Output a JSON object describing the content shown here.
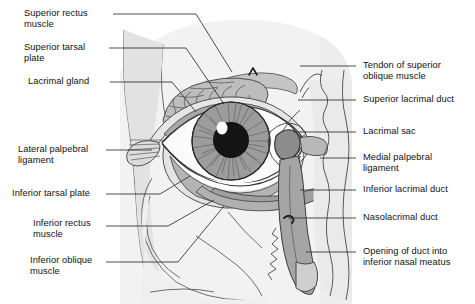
{
  "figure": {
    "background_color": "#ffffff",
    "tissue_color": "#f0f0f0",
    "shade_color": "#c9c9c9",
    "dark_shade_color": "#9a9a9a",
    "line_color": "#3a3a3a",
    "text_color": "#111111"
  },
  "labels_left": [
    {
      "text": "Superior rectus\nmuscle",
      "x": 24,
      "y": 8
    },
    {
      "text": "Superior tarsal\nplate",
      "x": 24,
      "y": 42
    },
    {
      "text": "Lacrimal gland",
      "x": 28,
      "y": 76
    },
    {
      "text": "Lateral palpebral\nligament",
      "x": 18,
      "y": 144
    },
    {
      "text": "Inferior tarsal plate",
      "x": 12,
      "y": 190
    },
    {
      "text": "Inferior rectus\nmuscle",
      "x": 33,
      "y": 218
    },
    {
      "text": "Inferior oblique\nmuscle",
      "x": 30,
      "y": 255
    }
  ],
  "labels_right": [
    {
      "text": "Tendon of superior\noblique muscle",
      "x": 363,
      "y": 60
    },
    {
      "text": "Superior lacrimal duct",
      "x": 363,
      "y": 96
    },
    {
      "text": "Lacrimal sac",
      "x": 363,
      "y": 128
    },
    {
      "text": "Medial palpebral\nligament",
      "x": 363,
      "y": 152
    },
    {
      "text": "Inferior lacrimal duct",
      "x": 363,
      "y": 186
    },
    {
      "text": "Nasolacrimal duct",
      "x": 363,
      "y": 214
    },
    {
      "text": "Opening of duct into\ninferior nasal meatus",
      "x": 363,
      "y": 246
    }
  ],
  "structures": [
    "superior rectus muscle",
    "superior tarsal plate",
    "lacrimal gland",
    "lateral palpebral ligament",
    "inferior tarsal plate",
    "inferior rectus muscle",
    "inferior oblique muscle",
    "tendon of superior oblique muscle",
    "trochlea",
    "superior lacrimal duct",
    "lacrimal sac",
    "medial palpebral ligament",
    "inferior lacrimal duct",
    "nasolacrimal duct",
    "opening of duct into inferior nasal meatus",
    "iris",
    "pupil",
    "sclera",
    "upper eyelid",
    "lower eyelid"
  ]
}
